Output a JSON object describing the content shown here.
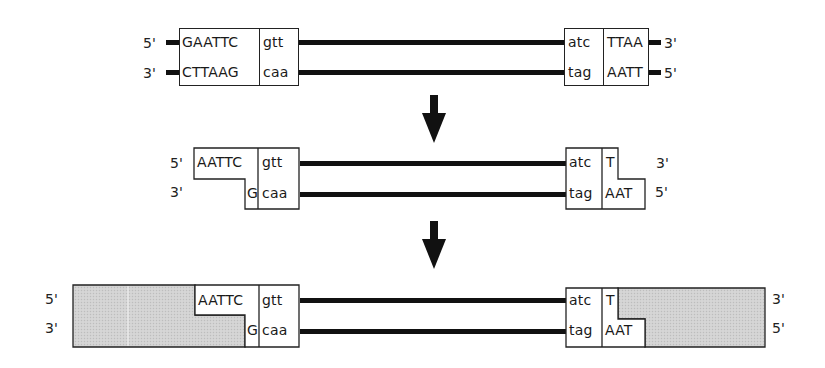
{
  "diagram": {
    "type": "DNA restriction cut and ligation schematic",
    "stages": [
      {
        "id": "intact",
        "left": {
          "top_end_label": "5'",
          "bottom_end_label": "3'",
          "top_site": "GAATTC",
          "bottom_site": "CTTAAG",
          "top_flank": "gtt",
          "bottom_flank": "caa"
        },
        "right": {
          "top_flank": "atc",
          "bottom_flank": "tag",
          "top_site": "TTAA",
          "bottom_site": "AATT",
          "top_end_label": "3'",
          "bottom_end_label": "5'"
        }
      },
      {
        "id": "cut",
        "left": {
          "top_end_label": "5'",
          "bottom_end_label": "3'",
          "top_overhang": "AATTC",
          "bottom_overhang": "G",
          "top_flank": "gtt",
          "bottom_flank": "caa"
        },
        "right": {
          "top_flank": "atc",
          "bottom_flank": "tag",
          "top_overhang": "T",
          "bottom_overhang": "AAT",
          "top_end_label": "3'",
          "bottom_end_label": "5'"
        }
      },
      {
        "id": "ligated",
        "left": {
          "top_end_label": "5'",
          "bottom_end_label": "3'",
          "top_overhang": "AATTC",
          "bottom_overhang": "G",
          "top_flank": "gtt",
          "bottom_flank": "caa"
        },
        "right": {
          "top_flank": "atc",
          "bottom_flank": "tag",
          "top_overhang": "T",
          "bottom_overhang": "AAT",
          "top_end_label": "3'",
          "bottom_end_label": "5'"
        }
      }
    ],
    "arrows": [
      "down-arrow",
      "down-arrow"
    ],
    "colors": {
      "strand": "#111111",
      "box_border": "#222222",
      "vector_fill": "#cfcfcf",
      "background": "#ffffff"
    }
  }
}
